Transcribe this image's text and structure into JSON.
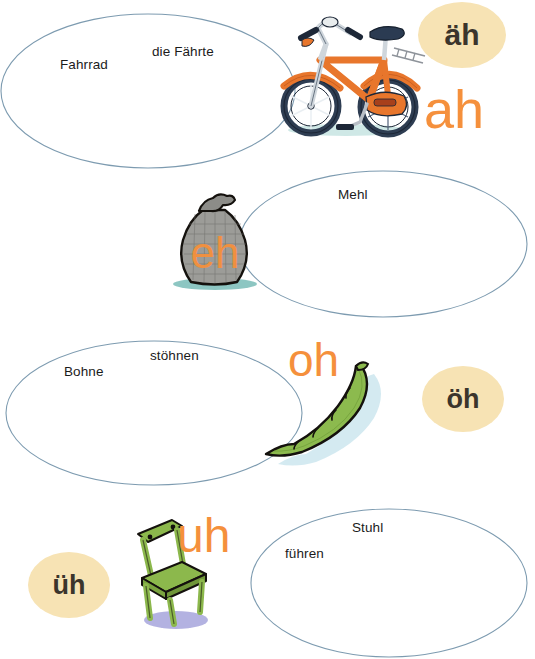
{
  "page": {
    "width": 535,
    "height": 659,
    "background_color": "#ffffff"
  },
  "colors": {
    "ellipse_stroke": "#7d9bb0",
    "word_text": "#1b1b1b",
    "badge_fill": "#f7e3b4",
    "badge_text": "#3b352c",
    "orange_sound": "#f5903c",
    "bike_frame": "#e8762c",
    "bike_tire": "#2e3d52",
    "sack_body": "#9c9c98",
    "bean_pod": "#8cba4e",
    "chair_wood": "#8cb84c",
    "chair_shadow": "#a6a5dc",
    "sack_shadow": "#79bcb7"
  },
  "rows": [
    {
      "id": "row-ah",
      "ellipse": {
        "x": 0,
        "y": 13,
        "w": 296,
        "h": 156
      },
      "words": [
        {
          "text": "Fahrrad",
          "x": 60,
          "y": 57
        },
        {
          "text": "die Fährte",
          "x": 152,
          "y": 44
        }
      ],
      "picture": {
        "name": "bicycle-illustration",
        "x": 268,
        "y": 4,
        "w": 160,
        "h": 136
      },
      "orange_sound": {
        "text": "ah",
        "x": 424,
        "y": 82,
        "size": 54
      },
      "badge": {
        "text": "äh",
        "x": 418,
        "y": 2,
        "w": 88,
        "h": 66,
        "size": 30
      }
    },
    {
      "id": "row-eh",
      "ellipse": {
        "x": 238,
        "y": 170,
        "w": 290,
        "h": 148
      },
      "words": [
        {
          "text": "Mehl",
          "x": 338,
          "y": 187
        }
      ],
      "picture": {
        "name": "flour-sack-illustration",
        "x": 163,
        "y": 190,
        "w": 105,
        "h": 100
      },
      "orange_sound": {
        "text": "eh",
        "x": 175,
        "y": 232,
        "size": 48
      },
      "badge": null
    },
    {
      "id": "row-oh",
      "ellipse": {
        "x": 5,
        "y": 340,
        "w": 298,
        "h": 146
      },
      "words": [
        {
          "text": "Bohne",
          "x": 64,
          "y": 364
        },
        {
          "text": "stöhnen",
          "x": 150,
          "y": 348
        }
      ],
      "picture": {
        "name": "bean-pod-illustration",
        "x": 262,
        "y": 358,
        "w": 122,
        "h": 112
      },
      "orange_sound": {
        "text": "oh",
        "x": 288,
        "y": 337,
        "size": 46
      },
      "badge": {
        "text": "öh",
        "x": 422,
        "y": 366,
        "w": 82,
        "h": 66,
        "size": 27
      }
    },
    {
      "id": "row-uh",
      "ellipse": {
        "x": 250,
        "y": 508,
        "w": 279,
        "h": 150
      },
      "words": [
        {
          "text": "Stuhl",
          "x": 352,
          "y": 520
        },
        {
          "text": "führen",
          "x": 285,
          "y": 546
        }
      ],
      "picture": {
        "name": "chair-illustration",
        "x": 130,
        "y": 512,
        "w": 92,
        "h": 120
      },
      "orange_sound": {
        "text": "uh",
        "x": 177,
        "y": 512,
        "size": 48
      },
      "badge": {
        "text": "üh",
        "x": 28,
        "y": 552,
        "w": 82,
        "h": 66,
        "size": 27
      }
    }
  ]
}
